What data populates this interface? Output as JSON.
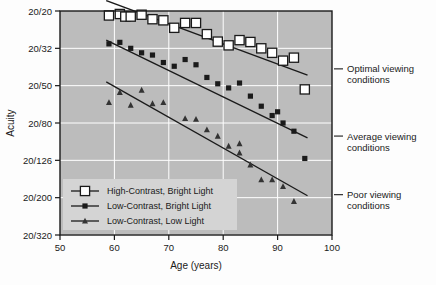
{
  "chart_data": {
    "type": "scatter",
    "title": "",
    "xlabel": "Age (years)",
    "ylabel": "Acuity",
    "xlim": [
      50,
      100
    ],
    "ylim": [
      0,
      6
    ],
    "xticks": [
      50,
      60,
      70,
      80,
      90,
      100
    ],
    "xtick_labels": [
      "50",
      "60",
      "70",
      "80",
      "90",
      "100"
    ],
    "ytick_labels": [
      "20/20",
      "20/32",
      "20/50",
      "20/80",
      "20/126",
      "20/200",
      "20/320"
    ],
    "ytick_values": [
      0,
      1,
      2,
      3,
      4,
      5,
      6
    ],
    "grid": true,
    "grid_color": "#ffffff",
    "plot_bgcolor": "#bcbcbc",
    "page_bgcolor": "#fdfdfd",
    "legend_position": "lower-left-inside",
    "series": [
      {
        "name": "High-Contrast, Bright Light",
        "marker": "open-square",
        "marker_color": "#ffffff",
        "marker_edge": "#1a1a1a",
        "line_color": "#1a1a1a",
        "fit_line": {
          "x": [
            58.5,
            95.5
          ],
          "y": [
            -0.28,
            1.72
          ]
        },
        "points": [
          {
            "x": 59,
            "y": 0.12
          },
          {
            "x": 61,
            "y": 0.08
          },
          {
            "x": 62,
            "y": 0.15
          },
          {
            "x": 63,
            "y": 0.15
          },
          {
            "x": 65,
            "y": 0.1
          },
          {
            "x": 67,
            "y": 0.22
          },
          {
            "x": 69,
            "y": 0.25
          },
          {
            "x": 71,
            "y": 0.45
          },
          {
            "x": 73,
            "y": 0.32
          },
          {
            "x": 75,
            "y": 0.32
          },
          {
            "x": 77,
            "y": 0.62
          },
          {
            "x": 79,
            "y": 0.82
          },
          {
            "x": 81,
            "y": 0.92
          },
          {
            "x": 83,
            "y": 0.78
          },
          {
            "x": 85,
            "y": 0.83
          },
          {
            "x": 87,
            "y": 1.0
          },
          {
            "x": 89,
            "y": 1.12
          },
          {
            "x": 91,
            "y": 1.33
          },
          {
            "x": 93,
            "y": 1.25
          },
          {
            "x": 95,
            "y": 2.1
          }
        ]
      },
      {
        "name": "Low-Contrast, Bright Light",
        "marker": "filled-square",
        "marker_color": "#1a1a1a",
        "marker_edge": "#1a1a1a",
        "line_color": "#1a1a1a",
        "fit_line": {
          "x": [
            58.5,
            95.5
          ],
          "y": [
            0.78,
            3.4
          ]
        },
        "points": [
          {
            "x": 59,
            "y": 0.88
          },
          {
            "x": 61,
            "y": 0.84
          },
          {
            "x": 63,
            "y": 1.0
          },
          {
            "x": 65,
            "y": 1.12
          },
          {
            "x": 67,
            "y": 1.18
          },
          {
            "x": 69,
            "y": 1.38
          },
          {
            "x": 71,
            "y": 1.48
          },
          {
            "x": 73,
            "y": 1.3
          },
          {
            "x": 75,
            "y": 1.44
          },
          {
            "x": 77,
            "y": 1.78
          },
          {
            "x": 79,
            "y": 1.95
          },
          {
            "x": 81,
            "y": 2.06
          },
          {
            "x": 83,
            "y": 1.93
          },
          {
            "x": 85,
            "y": 2.28
          },
          {
            "x": 87,
            "y": 2.55
          },
          {
            "x": 89,
            "y": 2.8
          },
          {
            "x": 90,
            "y": 2.7
          },
          {
            "x": 91,
            "y": 3.0
          },
          {
            "x": 93,
            "y": 3.22
          },
          {
            "x": 95,
            "y": 3.95
          }
        ]
      },
      {
        "name": "Low-Contrast, Low Light",
        "marker": "triangle",
        "marker_color": "#333333",
        "marker_edge": "#333333",
        "line_color": "#1a1a1a",
        "fit_line": {
          "x": [
            58.5,
            95.5
          ],
          "y": [
            1.9,
            4.95
          ]
        },
        "points": [
          {
            "x": 59,
            "y": 2.45
          },
          {
            "x": 61,
            "y": 2.18
          },
          {
            "x": 63,
            "y": 2.52
          },
          {
            "x": 65,
            "y": 2.12
          },
          {
            "x": 67,
            "y": 2.48
          },
          {
            "x": 69,
            "y": 2.45
          },
          {
            "x": 73,
            "y": 2.88
          },
          {
            "x": 75,
            "y": 2.9
          },
          {
            "x": 77,
            "y": 3.18
          },
          {
            "x": 79,
            "y": 3.35
          },
          {
            "x": 81,
            "y": 3.62
          },
          {
            "x": 83,
            "y": 3.8
          },
          {
            "x": 83,
            "y": 3.55
          },
          {
            "x": 85,
            "y": 4.12
          },
          {
            "x": 87,
            "y": 4.52
          },
          {
            "x": 89,
            "y": 4.52
          },
          {
            "x": 91,
            "y": 4.7
          },
          {
            "x": 93,
            "y": 5.1
          }
        ]
      }
    ],
    "annotations": [
      {
        "id": "optimal",
        "text_line1": "Optimal viewing",
        "text_line2": "conditions",
        "target_y": 1.55
      },
      {
        "id": "average",
        "text_line1": "Average viewing",
        "text_line2": "conditions",
        "target_y": 3.35
      },
      {
        "id": "poor",
        "text_line1": "Poor viewing",
        "text_line2": "conditions",
        "target_y": 4.92
      }
    ]
  }
}
